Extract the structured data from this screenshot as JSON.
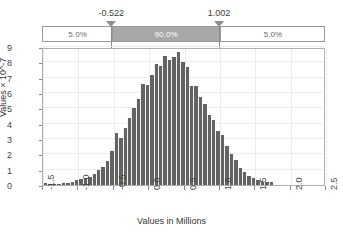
{
  "chart_data": {
    "type": "bar",
    "title": "",
    "xlabel": "Values in Millions",
    "ylabel": "Values × 10^-7",
    "ylabel_display": "Values × 10^-7",
    "xlim": [
      -1.5,
      2.5
    ],
    "ylim": [
      0,
      9
    ],
    "xticks": [
      "-1.5",
      "-1.0",
      "-0.5",
      "0.0",
      "0.5",
      "1.0",
      "1.5",
      "2.0",
      "2.5"
    ],
    "xtick_values": [
      -1.5,
      -1.0,
      -0.5,
      0.0,
      0.5,
      1.0,
      1.5,
      2.0,
      2.5
    ],
    "yticks": [
      "0",
      "1",
      "2",
      "3",
      "4",
      "5",
      "6",
      "7",
      "8",
      "9"
    ],
    "ytick_values": [
      0,
      1,
      2,
      3,
      4,
      5,
      6,
      7,
      8,
      9
    ],
    "grid": true,
    "legend": "none",
    "bar_color": "#636363",
    "bin_width": 0.0625,
    "x": [
      -1.46875,
      -1.40625,
      -1.34375,
      -1.28125,
      -1.21875,
      -1.15625,
      -1.09375,
      -1.03125,
      -0.96875,
      -0.90625,
      -0.84375,
      -0.78125,
      -0.71875,
      -0.65625,
      -0.59375,
      -0.53125,
      -0.46875,
      -0.40625,
      -0.34375,
      -0.28125,
      -0.21875,
      -0.15625,
      -0.09375,
      -0.03125,
      0.03125,
      0.09375,
      0.15625,
      0.21875,
      0.28125,
      0.34375,
      0.40625,
      0.46875,
      0.53125,
      0.59375,
      0.65625,
      0.71875,
      0.78125,
      0.84375,
      0.90625,
      0.96875,
      1.03125,
      1.09375,
      1.15625,
      1.21875,
      1.28125,
      1.34375,
      1.40625,
      1.46875,
      1.53125,
      1.59375,
      1.65625,
      1.71875
    ],
    "values": [
      0.1,
      0.05,
      0.05,
      0.06,
      0.1,
      0.14,
      0.18,
      0.3,
      0.38,
      0.45,
      0.55,
      0.7,
      0.95,
      1.2,
      1.55,
      2.2,
      3.4,
      3.05,
      3.75,
      4.4,
      5.05,
      5.6,
      6.6,
      6.55,
      7.2,
      7.9,
      7.75,
      8.4,
      8.15,
      8.35,
      8.7,
      8.05,
      7.7,
      6.45,
      6.45,
      5.75,
      5.3,
      4.55,
      4.25,
      3.55,
      3.25,
      2.55,
      2.05,
      1.6,
      1.1,
      0.85,
      0.6,
      0.45,
      0.3,
      0.22,
      0.2,
      0.18
    ]
  },
  "slider": {
    "left_marker_label": "-0.522",
    "right_marker_label": "1.002",
    "left_marker_value": -0.522,
    "right_marker_value": 1.002,
    "segments": [
      {
        "label": "5.0%",
        "value": 5.0
      },
      {
        "label": "90.0%",
        "value": 90.0
      },
      {
        "label": "5.0%",
        "value": 5.0
      }
    ],
    "mid_fill_color": "#a8a8a8"
  }
}
